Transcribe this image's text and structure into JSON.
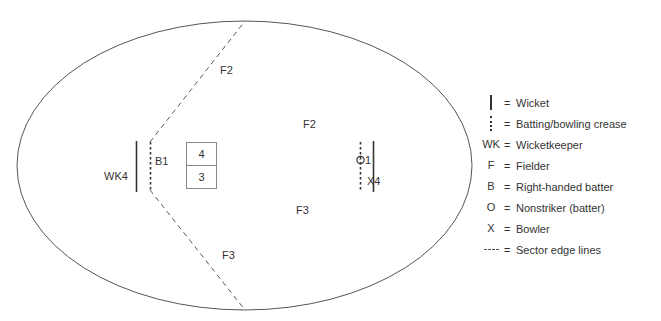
{
  "diagram": {
    "boundary_shape": "ellipse",
    "pitch_cells": [
      {
        "id": "cell-top",
        "label": "4"
      },
      {
        "id": "cell-bottom",
        "label": "3"
      }
    ],
    "field_labels": [
      {
        "name": "fielder-upper-sector",
        "text": "F2",
        "x": 220,
        "y": 74
      },
      {
        "name": "fielder-mid-right",
        "text": "F2",
        "x": 303,
        "y": 128
      },
      {
        "name": "fielder-lower-right",
        "text": "F3",
        "x": 296,
        "y": 214
      },
      {
        "name": "fielder-lower-sector",
        "text": "F3",
        "x": 222,
        "y": 259
      },
      {
        "name": "wicketkeeper-marker",
        "text": "WK4",
        "x": 104,
        "y": 180
      },
      {
        "name": "batter-marker",
        "text": "B1",
        "x": 155,
        "y": 165
      },
      {
        "name": "nonstriker-count",
        "text": "1",
        "x": 365,
        "y": 164
      },
      {
        "name": "bowler-marker",
        "text": "X4",
        "x": 367,
        "y": 185
      }
    ]
  },
  "legend": {
    "rows": [
      {
        "symbol_type": "wicket-bar",
        "symbol_text": "",
        "equals": "=",
        "label": "Wicket"
      },
      {
        "symbol_type": "crease-dots",
        "symbol_text": "",
        "equals": "=",
        "label": "Batting/bowling crease"
      },
      {
        "symbol_type": "text",
        "symbol_text": "WK",
        "equals": "=",
        "label": "Wicketkeeper"
      },
      {
        "symbol_type": "text",
        "symbol_text": "F",
        "equals": "=",
        "label": "Fielder"
      },
      {
        "symbol_type": "text",
        "symbol_text": "B",
        "equals": "=",
        "label": "Right-handed batter"
      },
      {
        "symbol_type": "text",
        "symbol_text": "O",
        "equals": "=",
        "label": "Nonstriker (batter)"
      },
      {
        "symbol_type": "text",
        "symbol_text": "X",
        "equals": "=",
        "label": "Bowler"
      },
      {
        "symbol_type": "sector-dash",
        "symbol_text": "",
        "equals": "=",
        "label": "Sector edge lines"
      }
    ]
  },
  "colors": {
    "stroke": "#555555",
    "text": "#333333",
    "marker": "#333333",
    "background": "#ffffff"
  }
}
